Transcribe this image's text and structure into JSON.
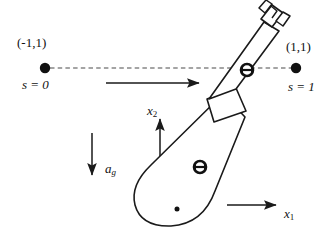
{
  "figure": {
    "background_color": "#ffffff",
    "stroke_color": "#1a1a1a",
    "width": 330,
    "height": 246
  },
  "labels": {
    "left_point_coord": "(-1,1)",
    "left_point_s": "s = 0",
    "right_point_coord": "(1,1)",
    "right_point_s": "s = 1",
    "axis_x1_name": "x",
    "axis_x1_sub": "1",
    "axis_x2_name": "x",
    "axis_x2_sub": "2",
    "gravity_name": "a",
    "gravity_sub": "g"
  },
  "markers": {
    "left_endpoint": {
      "name": "start-point",
      "cx": 45,
      "cy": 68,
      "r": 5.2,
      "fill": "#111111"
    },
    "right_endpoint": {
      "name": "end-point",
      "cx": 296,
      "cy": 68,
      "r": 5.2,
      "fill": "#111111"
    },
    "pivot_joint": {
      "name": "pivot-joint",
      "cx": 247,
      "cy": 70,
      "r": 6.0
    },
    "body_joint": {
      "name": "body-joint",
      "cx": 200,
      "cy": 167,
      "r": 6.0
    },
    "body_center": {
      "name": "body-center-dot",
      "cx": 177,
      "cy": 208,
      "r": 2.4,
      "fill": "#111111"
    }
  },
  "geometry": {
    "dashed_path_y": 68,
    "dashed_path_x_start": 50,
    "dashed_path_x_end": 291,
    "motion_arrow": {
      "x1": 106,
      "y1": 83,
      "x2": 201,
      "y2": 83
    },
    "gravity_arrow": {
      "x1": 92,
      "y1": 133,
      "x2": 92,
      "y2": 177
    },
    "x1_arrow": {
      "x1": 227,
      "y1": 205,
      "x2": 278,
      "y2": 205
    },
    "x2_arrow": {
      "x1": 160,
      "y1": 168,
      "x2": 160,
      "y2": 117
    },
    "body_outline": "M 244,118 L 214,192 Q 201,224 170,226 Q 141,227 136,205 Q 132,186 152,166 L 222,95 Z",
    "wedge": "M 217,120 L 209,98 L 237,89 L 245,112 Z",
    "arm_left_edge": "M 211,99 L 264,21",
    "arm_right_edge": "M 237,89 L 281,28",
    "gripper_body": "M 264,21 L 259,14 L 272,5 L 278,12 Z",
    "gripper_prong_left": "M 261,11 L 256,4 L 263,0",
    "gripper_prong_right": "M 276,22 L 283,18 L 288,12"
  },
  "colors": {
    "line": "#1a1a1a",
    "dash": "#4a4a4a",
    "fill": "#ffffff",
    "text": "#111111"
  }
}
